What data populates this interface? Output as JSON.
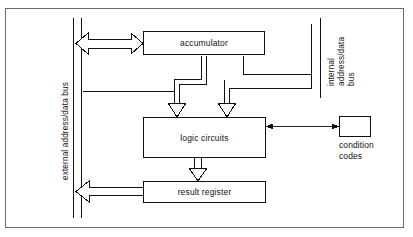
{
  "diagram": {
    "colors": {
      "frame": "#6b6b6b",
      "line": "#111111",
      "box_fill": "#ffffff",
      "text": "#111111"
    },
    "nodes": [
      {
        "id": "accumulator",
        "label": "accumulator"
      },
      {
        "id": "logic-circuits",
        "label": "logic circuits"
      },
      {
        "id": "result-register",
        "label": "result register"
      },
      {
        "id": "condition-codes",
        "label": ""
      }
    ],
    "labels": {
      "external_bus": "external address/data bus",
      "internal_bus_line1": "internal",
      "internal_bus_line2": "address/data",
      "internal_bus_line3": "bus",
      "condition_codes_line1": "condition",
      "condition_codes_line2": "codes"
    },
    "connections": [
      {
        "id": "bus-accumulator",
        "style": "hollow-block-arrow",
        "heads": "both",
        "from": "external address/data bus",
        "to": "accumulator"
      },
      {
        "id": "accumulator-logic-left",
        "style": "hollow-block-arrow",
        "heads": "down",
        "from": "accumulator",
        "to": "logic circuits"
      },
      {
        "id": "accumulator-logic-right",
        "style": "hollow-block-arrow",
        "heads": "down",
        "from": "accumulator",
        "to": "logic circuits"
      },
      {
        "id": "logic-result",
        "style": "hollow-block-arrow",
        "heads": "down",
        "from": "logic circuits",
        "to": "result register"
      },
      {
        "id": "result-bus",
        "style": "hollow-block-arrow",
        "heads": "left",
        "from": "result register",
        "to": "external address/data bus"
      },
      {
        "id": "logic-condition",
        "style": "thin-line-arrow",
        "heads": "both",
        "from": "logic circuits",
        "to": "condition codes"
      }
    ]
  }
}
